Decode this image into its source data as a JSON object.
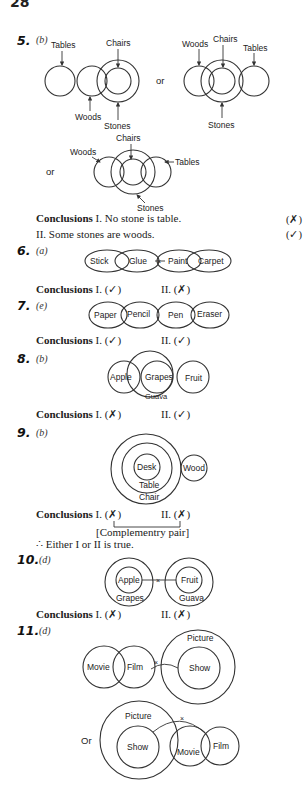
{
  "page": {
    "number": "28"
  },
  "questions": [
    {
      "number": "5.",
      "option": "(b)",
      "diagrams": [
        {
          "labels": [
            "Tables",
            "Chairs",
            "Woods",
            "Stones"
          ]
        },
        {
          "separator": "or",
          "labels": [
            "Woods",
            "Chairs",
            "Tables",
            "Stones"
          ]
        },
        {
          "separator": "or",
          "labels": [
            "Chairs",
            "Woods",
            "Tables",
            "Stones"
          ]
        }
      ],
      "conclusions": {
        "heading": "Conclusions",
        "I": "I. No stone is table.",
        "I_mark": "(✗)",
        "II": "II. Some stones are woods.",
        "II_mark": "(✓)"
      }
    },
    {
      "number": "6.",
      "option": "(a)",
      "diagram": {
        "labels": [
          "Stick",
          "Glue",
          "Paint",
          "Carpet"
        ],
        "cross": "×"
      },
      "conclusions": {
        "heading": "Conclusions",
        "I": "I. (✓)",
        "II": "II. (✗)"
      }
    },
    {
      "number": "7.",
      "option": "(e)",
      "diagram": {
        "labels": [
          "Paper",
          "Pencil",
          "Pen",
          "Eraser"
        ]
      },
      "conclusions": {
        "heading": "Conclusions",
        "I": "I. (✓)",
        "II": "II. (✓)"
      }
    },
    {
      "number": "8.",
      "option": "(b)",
      "diagram": {
        "labels": [
          "Apple",
          "Grapes",
          "Fruit",
          "Guava"
        ]
      },
      "conclusions": {
        "heading": "Conclusions",
        "I": "I. (✗)",
        "II": "II. (✓)"
      }
    },
    {
      "number": "9.",
      "option": "(b)",
      "diagram": {
        "labels": [
          "Desk",
          "Table",
          "Chair",
          "Wood"
        ]
      },
      "conclusions": {
        "heading": "Conclusions",
        "I": "I. (✗)",
        "II": "II. (✗)"
      },
      "note": "[Complementry pair]",
      "result": "∴ Either I or II is true."
    },
    {
      "number": "10.",
      "option": "(d)",
      "diagram": {
        "labels": [
          "Apple",
          "Grapes",
          "Fruit",
          "Guava"
        ],
        "cross": "×"
      },
      "conclusions": {
        "heading": "Conclusions",
        "I": "I. (✗)",
        "II": "II. (✗)"
      }
    },
    {
      "number": "11.",
      "option": "(d)",
      "diagrams": [
        {
          "labels": [
            "Movie",
            "Film",
            "Picture",
            "Show"
          ],
          "cross": "×"
        },
        {
          "separator": "Or",
          "labels": [
            "Picture",
            "Show",
            "Movie",
            "Film"
          ],
          "cross": "×"
        }
      ]
    }
  ]
}
